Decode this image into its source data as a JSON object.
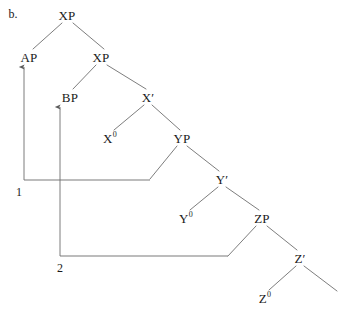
{
  "figure": {
    "letter": "b.",
    "letter_pos": {
      "x": 13,
      "y": 14
    },
    "width": 347,
    "height": 316,
    "line_color": "#6e6e6e",
    "text_color": "#1a1a1a",
    "background": "#ffffff"
  },
  "nodes": [
    {
      "id": "xp-root",
      "base": "XP",
      "sup": "",
      "prime": false,
      "x": 67,
      "y": 15
    },
    {
      "id": "ap",
      "base": "AP",
      "sup": "",
      "prime": false,
      "x": 29,
      "y": 57
    },
    {
      "id": "xp-lower",
      "base": "XP",
      "sup": "",
      "prime": false,
      "x": 101,
      "y": 57
    },
    {
      "id": "bp",
      "base": "BP",
      "sup": "",
      "prime": false,
      "x": 70,
      "y": 97
    },
    {
      "id": "x-bar",
      "base": "X",
      "sup": "",
      "prime": true,
      "x": 148,
      "y": 97
    },
    {
      "id": "x-zero",
      "base": "X",
      "sup": "0",
      "prime": false,
      "x": 110,
      "y": 138
    },
    {
      "id": "yp",
      "base": "YP",
      "sup": "",
      "prime": false,
      "x": 182,
      "y": 138
    },
    {
      "id": "y-bar",
      "base": "Y",
      "sup": "",
      "prime": true,
      "x": 222,
      "y": 179
    },
    {
      "id": "y-zero",
      "base": "Y",
      "sup": "0",
      "prime": false,
      "x": 186,
      "y": 218
    },
    {
      "id": "zp",
      "base": "ZP",
      "sup": "",
      "prime": false,
      "x": 262,
      "y": 218
    },
    {
      "id": "z-bar",
      "base": "Z",
      "sup": "",
      "prime": true,
      "x": 300,
      "y": 258
    },
    {
      "id": "z-zero",
      "base": "Z",
      "sup": "0",
      "prime": false,
      "x": 265,
      "y": 298
    }
  ],
  "branches": [
    {
      "id": "xp-root-to-ap",
      "from": "xp-root",
      "to": "ap",
      "x1": 62,
      "y1": 23,
      "x2": 33,
      "y2": 49
    },
    {
      "id": "xp-root-to-xp",
      "from": "xp-root",
      "to": "xp-lower",
      "x1": 73,
      "y1": 23,
      "x2": 104,
      "y2": 49
    },
    {
      "id": "xp-to-bp",
      "from": "xp-lower",
      "to": "bp",
      "x1": 96,
      "y1": 65,
      "x2": 73,
      "y2": 89
    },
    {
      "id": "xp-to-x-bar",
      "from": "xp-lower",
      "to": "x-bar",
      "x1": 107,
      "y1": 65,
      "x2": 146,
      "y2": 89
    },
    {
      "id": "x-bar-to-x-zero",
      "from": "x-bar",
      "to": "x-zero",
      "x1": 144,
      "y1": 105,
      "x2": 114,
      "y2": 130
    },
    {
      "id": "x-bar-to-yp",
      "from": "x-bar",
      "to": "yp",
      "x1": 152,
      "y1": 105,
      "x2": 180,
      "y2": 130
    },
    {
      "id": "yp-to-trace1",
      "from": "yp",
      "to": "trace-1",
      "x1": 177,
      "y1": 146,
      "x2": 150,
      "y2": 179
    },
    {
      "id": "yp-to-y-bar",
      "from": "yp",
      "to": "y-bar",
      "x1": 187,
      "y1": 146,
      "x2": 219,
      "y2": 171
    },
    {
      "id": "y-bar-to-y-zero",
      "from": "y-bar",
      "to": "y-zero",
      "x1": 218,
      "y1": 187,
      "x2": 190,
      "y2": 210
    },
    {
      "id": "y-bar-to-zp",
      "from": "y-bar",
      "to": "zp",
      "x1": 226,
      "y1": 187,
      "x2": 259,
      "y2": 210
    },
    {
      "id": "zp-to-trace2",
      "from": "zp",
      "to": "trace-2",
      "x1": 256,
      "y1": 226,
      "x2": 228,
      "y2": 256
    },
    {
      "id": "zp-to-z-bar",
      "from": "zp",
      "to": "z-bar",
      "x1": 267,
      "y1": 226,
      "x2": 297,
      "y2": 250
    },
    {
      "id": "z-bar-to-z-zero",
      "from": "z-bar",
      "to": "z-zero",
      "x1": 296,
      "y1": 266,
      "x2": 269,
      "y2": 290
    },
    {
      "id": "z-bar-to-open",
      "from": "z-bar",
      "to": "",
      "x1": 304,
      "y1": 266,
      "x2": 337,
      "y2": 291
    }
  ],
  "traces": [
    {
      "id": "trace-line-1",
      "x1": 24,
      "y1": 180,
      "x2": 150,
      "y2": 180
    },
    {
      "id": "trace-line-2",
      "x1": 60,
      "y1": 256,
      "x2": 228,
      "y2": 256
    }
  ],
  "movements": [
    {
      "id": "movement-1",
      "label": "1",
      "label_pos": {
        "x": 19,
        "y": 192
      },
      "path": "M 24 180 L 24 67",
      "arrow_x": 24,
      "arrow_y": 65,
      "target": "ap"
    },
    {
      "id": "movement-2",
      "label": "2",
      "label_pos": {
        "x": 60,
        "y": 268
      },
      "path": "M 60 256 L 60 107",
      "arrow_x": 60,
      "arrow_y": 105,
      "target": "bp"
    }
  ]
}
